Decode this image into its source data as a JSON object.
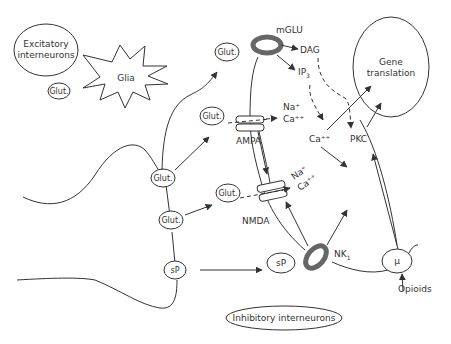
{
  "diagram": {
    "type": "pain-pathway-neurotransmission",
    "nodes": {
      "excitatory_interneurons": "Excitatory interneurons",
      "excitatory_line1": "Excitatory",
      "excitatory_line2": "interneurons",
      "glia": "Glia",
      "glut_left": "Glut.",
      "glut_top": "Glut.",
      "glut_ampa": "Glut.",
      "glut_nmda": "Glut.",
      "glut_terminal_1": "Glut.",
      "glut_terminal_2": "Glut.",
      "sp_terminal": "sP",
      "sp_released": "sP",
      "mglu": "mGLU",
      "dag": "DAG",
      "ip3": "IP",
      "ip3_sub": "3",
      "ampa": "AMPA",
      "nmda": "NMDA",
      "na_plus_1": "Na⁺",
      "ca_plus_1": "Ca⁺⁺",
      "na_plus_2": "Na⁺",
      "ca_plus_2": "Ca⁺⁺",
      "ca_internal": "Ca⁺⁺",
      "pkc": "PKC",
      "gene_line1": "Gene",
      "gene_line2": "translation",
      "nk1": "NK",
      "nk1_sub": "1",
      "mu": "μ",
      "opioids": "Opioids",
      "inhibitory_interneurons": "Inhibitory interneurons"
    },
    "colors": {
      "line": "#333333",
      "receptor_fill": "#777777",
      "background": "#ffffff"
    }
  }
}
